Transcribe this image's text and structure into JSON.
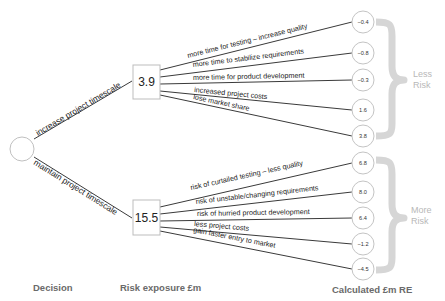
{
  "diagram": {
    "type": "decision-tree",
    "root": {
      "label": ""
    },
    "decisions": [
      {
        "label": "increase project timescale",
        "risk_exposure": "3.9",
        "outcomes": [
          {
            "label": "more time for testing – increase quality",
            "re": "−0.4"
          },
          {
            "label": "more time to stabilize requirements",
            "re": "−0.8"
          },
          {
            "label": "more time for product development",
            "re": "−0.3"
          },
          {
            "label": "increased project costs",
            "re": "1.6"
          },
          {
            "label": "lose market share",
            "re": "3.8"
          }
        ],
        "bracket_label_line1": "Less",
        "bracket_label_line2": "Risk"
      },
      {
        "label": "maintain project timescale",
        "risk_exposure": "15.5",
        "outcomes": [
          {
            "label": "risk of curtailed testing – less quality",
            "re": "6.8"
          },
          {
            "label": "risk of unstable/changing requirements",
            "re": "8.0"
          },
          {
            "label": "risk of hurried product development",
            "re": "6.4"
          },
          {
            "label": "less project costs",
            "re": "−1.2"
          },
          {
            "label": "gain faster entry to market",
            "re": "−4.5"
          }
        ],
        "bracket_label_line1": "More",
        "bracket_label_line2": "Risk"
      }
    ],
    "footer": {
      "decision": "Decision",
      "risk_exposure": "Risk exposure £m",
      "calculated": "Calculated £m RE"
    },
    "colors": {
      "line": "#3a3a3a",
      "bracket": "#d6d6d6",
      "bracket_text": "#b8b8b8",
      "footer_text": "#6a6a6a"
    }
  }
}
